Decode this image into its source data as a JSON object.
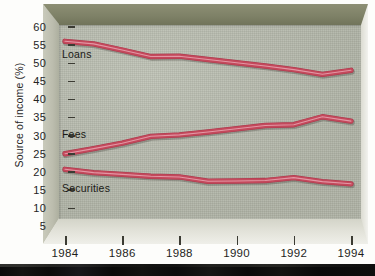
{
  "chart_data": {
    "type": "line",
    "title": "",
    "xlabel": "",
    "ylabel": "Source of income (%)",
    "xlim": [
      1984,
      1994
    ],
    "ylim": [
      5,
      60
    ],
    "ytick_labels": [
      "60",
      "55",
      "50",
      "45",
      "40",
      "35",
      "30",
      "25",
      "20",
      "15",
      "10",
      "5"
    ],
    "ytick_values": [
      60,
      55,
      50,
      45,
      40,
      35,
      30,
      25,
      20,
      15,
      10,
      5
    ],
    "xtick_labels": [
      "1984",
      "1986",
      "1988",
      "1990",
      "1992",
      "1994"
    ],
    "xtick_values": [
      1984,
      1986,
      1988,
      1990,
      1992,
      1994
    ],
    "x": [
      1984,
      1985,
      1986,
      1987,
      1988,
      1989,
      1990,
      1991,
      1992,
      1993,
      1994
    ],
    "grid": false,
    "legend": "inline-labels",
    "line_color": "#c4495c",
    "line_highlight": "#e58f9e",
    "plot_background": "#b7bbad",
    "series": [
      {
        "name": "Loans",
        "label": "Loans",
        "values": [
          56.0,
          55.3,
          53.6,
          51.8,
          51.9,
          51.0,
          50.1,
          49.2,
          48.2,
          46.9,
          48.0
        ]
      },
      {
        "name": "Fees",
        "label": "Fees",
        "values": [
          25.0,
          26.4,
          27.9,
          29.8,
          30.2,
          31.0,
          31.9,
          32.8,
          33.0,
          35.2,
          34.0
        ]
      },
      {
        "name": "Securities",
        "label": "Securities",
        "values": [
          20.7,
          19.8,
          19.3,
          18.8,
          18.6,
          17.4,
          17.5,
          17.6,
          18.4,
          17.3,
          16.7
        ]
      }
    ],
    "series_label_positions": [
      {
        "name": "Loans",
        "left": 62,
        "top": 48
      },
      {
        "name": "Fees",
        "left": 62,
        "top": 128
      },
      {
        "name": "Securities",
        "left": 62,
        "top": 182
      }
    ]
  }
}
